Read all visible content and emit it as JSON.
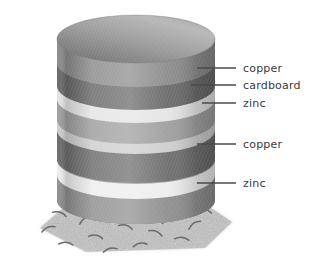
{
  "figure": {
    "background_color": "#ffffff",
    "alt": "Stack of alternating copper, cardboard and zinc discs resting on ground"
  },
  "pile": {
    "description": "voltaic pile cylinder of stacked discs",
    "center_x": 136,
    "radius_x": 79,
    "radius_y": 24,
    "top_y": 39,
    "bottom_y": 200,
    "layers": [
      {
        "name": "top-disc-copper",
        "material": "copper",
        "y_top": 39,
        "y_bottom": 62,
        "color": "#8f8f8f"
      },
      {
        "name": "band-copper-1",
        "material": "copper",
        "y_top": 62,
        "y_bottom": 84,
        "color": "#6e6e6e"
      },
      {
        "name": "band-cardboard-1",
        "material": "cardboard",
        "y_top": 84,
        "y_bottom": 97,
        "color": "#d5d5d5"
      },
      {
        "name": "band-zinc-1",
        "material": "zinc",
        "y_top": 97,
        "y_bottom": 118,
        "color": "#9a9a9a"
      },
      {
        "name": "band-cardboard-2",
        "material": "cardboard",
        "y_top": 118,
        "y_bottom": 128,
        "color": "#c9c9c9"
      },
      {
        "name": "band-copper-2",
        "material": "copper",
        "y_top": 128,
        "y_bottom": 156,
        "color": "#6e6e6e"
      },
      {
        "name": "band-cardboard-3",
        "material": "cardboard",
        "y_top": 156,
        "y_bottom": 172,
        "color": "#e2e2e2"
      },
      {
        "name": "band-zinc-2",
        "material": "zinc",
        "y_top": 172,
        "y_bottom": 203,
        "color": "#8d8d8d"
      }
    ]
  },
  "ground": {
    "name": "ground-patch",
    "color": "#d3d3d3",
    "speckle_color": "#9e9e9e",
    "blade_color": "#6b6b6b",
    "blades": [
      {
        "x": 48,
        "y": 228,
        "rot": -18
      },
      {
        "x": 66,
        "y": 243,
        "rot": 8
      },
      {
        "x": 85,
        "y": 219,
        "rot": -28
      },
      {
        "x": 96,
        "y": 236,
        "rot": 14
      },
      {
        "x": 110,
        "y": 249,
        "rot": -10
      },
      {
        "x": 126,
        "y": 226,
        "rot": 20
      },
      {
        "x": 140,
        "y": 244,
        "rot": -6
      },
      {
        "x": 156,
        "y": 232,
        "rot": 26
      },
      {
        "x": 168,
        "y": 219,
        "rot": -22
      },
      {
        "x": 182,
        "y": 238,
        "rot": 10
      },
      {
        "x": 194,
        "y": 224,
        "rot": -30
      },
      {
        "x": 60,
        "y": 213,
        "rot": 22
      },
      {
        "x": 150,
        "y": 213,
        "rot": -14
      },
      {
        "x": 205,
        "y": 210,
        "rot": 18
      }
    ]
  },
  "labels": [
    {
      "id": "label-copper-top",
      "text": "copper",
      "text_x": 243,
      "text_y": 72,
      "leader_x1": 197,
      "leader_x2": 236,
      "leader_y": 68
    },
    {
      "id": "label-cardboard",
      "text": "cardboard",
      "text_x": 243,
      "text_y": 89,
      "leader_x1": 191,
      "leader_x2": 236,
      "leader_y": 85
    },
    {
      "id": "label-zinc-upper",
      "text": "zinc",
      "text_x": 243,
      "text_y": 107,
      "leader_x1": 202,
      "leader_x2": 236,
      "leader_y": 103
    },
    {
      "id": "label-copper-lower",
      "text": "copper",
      "text_x": 243,
      "text_y": 148,
      "leader_x1": 197,
      "leader_x2": 236,
      "leader_y": 144
    },
    {
      "id": "label-zinc-lower",
      "text": "zinc",
      "text_x": 243,
      "text_y": 187,
      "leader_x1": 197,
      "leader_x2": 236,
      "leader_y": 183
    }
  ]
}
